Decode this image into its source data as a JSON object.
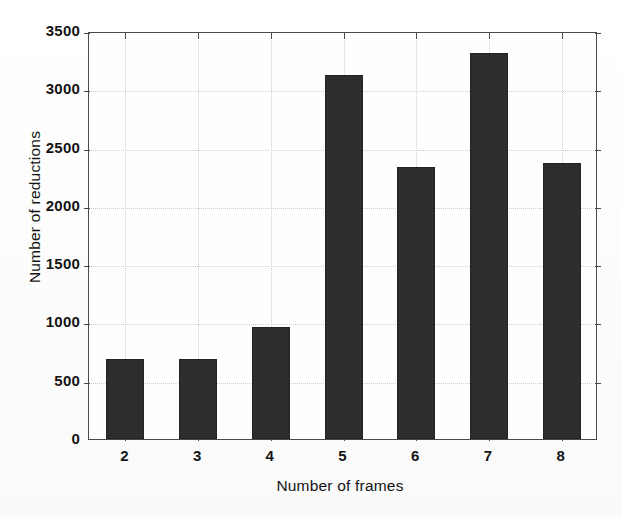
{
  "chart_data": {
    "type": "bar",
    "title": "",
    "subtitle": "",
    "xlabel": "Number of frames",
    "ylabel": "Number of reductions",
    "categories": [
      "2",
      "3",
      "4",
      "5",
      "6",
      "7",
      "8"
    ],
    "values": [
      685,
      685,
      960,
      3120,
      2330,
      3310,
      2365
    ],
    "series": [
      {
        "name": "Number of reductions",
        "values": [
          685,
          685,
          960,
          3120,
          2330,
          3310,
          2365
        ]
      }
    ],
    "ylim": [
      0,
      3500
    ],
    "yticks": [
      0,
      500,
      1000,
      1500,
      2000,
      2500,
      3000,
      3500
    ],
    "ytick_labels": [
      "0",
      "500",
      "1000",
      "1500",
      "2000",
      "2500",
      "3000",
      "3500"
    ],
    "xtick_labels": [
      "2",
      "3",
      "4",
      "5",
      "6",
      "7",
      "8"
    ],
    "grid": true,
    "grid_style": "dotted",
    "legend": null,
    "legend_position": "none",
    "bar_color": "#2d2d2d",
    "axis_color": "#4a4a4a",
    "grid_color": "#cfcfcf",
    "background_color": "#fefefe",
    "annotations": []
  }
}
